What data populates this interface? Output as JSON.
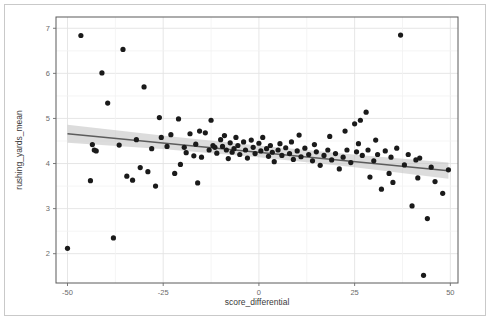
{
  "figure": {
    "background_color": "#ffffff",
    "border_color": "#c9c9c9",
    "panel_background": "#ffffff",
    "panel_border_color": "#5a5a5a"
  },
  "chart_data": {
    "type": "scatter",
    "title": "",
    "xlabel": "score_differential",
    "ylabel": "rushing_yards_mean",
    "xlim": [
      -53,
      52
    ],
    "ylim": [
      1.35,
      7.25
    ],
    "xticks": [
      -50,
      -25,
      0,
      25,
      50
    ],
    "xtick_labels": [
      "-50",
      "-25",
      "0",
      "25",
      "50"
    ],
    "yticks": [
      2,
      3,
      4,
      5,
      6,
      7
    ],
    "ytick_labels": [
      "2",
      "3",
      "4",
      "5",
      "6",
      "7"
    ],
    "grid": true,
    "grid_color": "#e3e3e3",
    "legend": "none",
    "point_color": "#1a1a1a",
    "point_size": 2.6,
    "regression": {
      "type": "linear",
      "line_color": "#5c5c5c",
      "line_width": 1.6,
      "band_color": "#bfbfbf",
      "band_opacity": 0.55,
      "x_start": -50.0,
      "x_end": 49.5,
      "y_start": 4.66,
      "y_end": 3.84,
      "band_upper_start": 4.86,
      "band_upper_end": 4.02,
      "band_lower_start": 4.46,
      "band_lower_end": 3.66,
      "band_upper_mid": 4.36,
      "band_lower_mid": 4.22
    },
    "points": [
      [
        -50.0,
        2.12
      ],
      [
        -46.5,
        6.84
      ],
      [
        -44.0,
        3.62
      ],
      [
        -43.5,
        4.42
      ],
      [
        -43.0,
        4.3
      ],
      [
        -42.5,
        4.28
      ],
      [
        -41.0,
        6.01
      ],
      [
        -39.5,
        5.34
      ],
      [
        -38.0,
        2.35
      ],
      [
        -36.5,
        4.41
      ],
      [
        -35.5,
        6.53
      ],
      [
        -34.5,
        3.72
      ],
      [
        -33.0,
        3.63
      ],
      [
        -32.0,
        4.53
      ],
      [
        -31.0,
        3.91
      ],
      [
        -30.0,
        5.7
      ],
      [
        -29.0,
        3.82
      ],
      [
        -28.0,
        4.33
      ],
      [
        -27.0,
        3.5
      ],
      [
        -26.0,
        5.02
      ],
      [
        -25.5,
        4.58
      ],
      [
        -24.0,
        4.38
      ],
      [
        -23.0,
        4.64
      ],
      [
        -22.0,
        3.78
      ],
      [
        -21.0,
        4.99
      ],
      [
        -20.5,
        3.98
      ],
      [
        -19.5,
        4.36
      ],
      [
        -19.0,
        4.24
      ],
      [
        -18.0,
        4.66
      ],
      [
        -17.0,
        4.17
      ],
      [
        -16.5,
        4.43
      ],
      [
        -16.0,
        3.57
      ],
      [
        -15.5,
        4.72
      ],
      [
        -15.0,
        4.14
      ],
      [
        -14.0,
        4.68
      ],
      [
        -13.0,
        4.3
      ],
      [
        -12.5,
        4.96
      ],
      [
        -12.0,
        4.4
      ],
      [
        -11.5,
        4.36
      ],
      [
        -11.0,
        4.23
      ],
      [
        -10.0,
        4.53
      ],
      [
        -9.5,
        4.38
      ],
      [
        -9.0,
        4.62
      ],
      [
        -8.5,
        4.3
      ],
      [
        -8.0,
        4.11
      ],
      [
        -7.5,
        4.46
      ],
      [
        -7.0,
        4.25
      ],
      [
        -6.5,
        4.33
      ],
      [
        -6.0,
        4.58
      ],
      [
        -5.5,
        4.4
      ],
      [
        -5.0,
        4.2
      ],
      [
        -4.0,
        4.48
      ],
      [
        -3.5,
        4.3
      ],
      [
        -3.0,
        4.12
      ],
      [
        -2.0,
        4.52
      ],
      [
        -1.5,
        4.36
      ],
      [
        -1.0,
        4.22
      ],
      [
        0.0,
        4.45
      ],
      [
        0.5,
        4.28
      ],
      [
        1.0,
        4.58
      ],
      [
        2.0,
        4.33
      ],
      [
        2.5,
        4.16
      ],
      [
        3.0,
        4.4
      ],
      [
        3.5,
        4.25
      ],
      [
        4.0,
        4.04
      ],
      [
        5.0,
        4.3
      ],
      [
        5.5,
        4.44
      ],
      [
        6.0,
        4.18
      ],
      [
        7.0,
        4.35
      ],
      [
        8.0,
        4.22
      ],
      [
        8.5,
        4.48
      ],
      [
        9.0,
        4.09
      ],
      [
        10.0,
        4.28
      ],
      [
        10.5,
        4.63
      ],
      [
        11.0,
        4.15
      ],
      [
        12.0,
        4.34
      ],
      [
        13.0,
        4.2
      ],
      [
        14.0,
        4.06
      ],
      [
        14.5,
        4.42
      ],
      [
        15.0,
        4.26
      ],
      [
        16.0,
        3.96
      ],
      [
        17.0,
        4.18
      ],
      [
        18.0,
        4.3
      ],
      [
        18.5,
        4.6
      ],
      [
        19.0,
        4.08
      ],
      [
        20.0,
        4.22
      ],
      [
        21.0,
        3.88
      ],
      [
        22.0,
        4.14
      ],
      [
        22.5,
        4.72
      ],
      [
        23.0,
        4.3
      ],
      [
        24.0,
        4.02
      ],
      [
        25.0,
        4.88
      ],
      [
        25.5,
        4.26
      ],
      [
        26.0,
        4.44
      ],
      [
        26.5,
        4.96
      ],
      [
        27.0,
        4.18
      ],
      [
        28.0,
        5.14
      ],
      [
        28.5,
        4.3
      ],
      [
        29.0,
        3.7
      ],
      [
        30.0,
        4.06
      ],
      [
        30.5,
        4.52
      ],
      [
        31.0,
        4.2
      ],
      [
        32.0,
        3.43
      ],
      [
        33.0,
        4.28
      ],
      [
        34.0,
        3.78
      ],
      [
        34.5,
        4.14
      ],
      [
        35.0,
        3.58
      ],
      [
        36.0,
        4.34
      ],
      [
        37.0,
        6.85
      ],
      [
        38.0,
        3.97
      ],
      [
        39.0,
        4.2
      ],
      [
        40.0,
        3.06
      ],
      [
        41.0,
        4.08
      ],
      [
        41.5,
        3.68
      ],
      [
        42.0,
        4.12
      ],
      [
        43.0,
        1.52
      ],
      [
        44.0,
        2.78
      ],
      [
        45.0,
        3.92
      ],
      [
        46.0,
        3.6
      ],
      [
        48.0,
        3.34
      ],
      [
        49.5,
        3.86
      ]
    ]
  }
}
